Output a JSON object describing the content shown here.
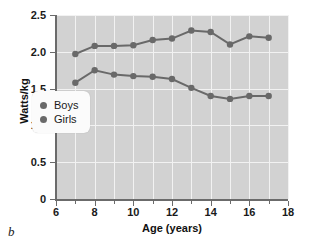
{
  "panel_label": "b",
  "chart_data": {
    "type": "line",
    "title": "",
    "xlabel": "Age (years)",
    "ylabel": "Watts/kg",
    "xlim": [
      6,
      18
    ],
    "ylim": [
      0,
      2.5
    ],
    "xticks": [
      6,
      8,
      10,
      12,
      14,
      16,
      18
    ],
    "xtick_labels": [
      "6",
      "8",
      "10",
      "12",
      "14",
      "16",
      "18"
    ],
    "xminorticks": [
      7,
      9,
      11,
      13,
      15,
      17
    ],
    "yticks": [
      0,
      0.5,
      1.0,
      1.5,
      2.0,
      2.5
    ],
    "ytick_labels": [
      "0",
      "0.5",
      "1.0",
      "1.5",
      "2.0",
      "2.5"
    ],
    "grid": true,
    "legend_position": "center-left",
    "plot_background": "#d2d2d2",
    "gridline_color": "#f2f2f2",
    "series_color": "#696969",
    "x": [
      7,
      8,
      9,
      10,
      11,
      12,
      13,
      14,
      15,
      16,
      17
    ],
    "series": [
      {
        "name": "Boys",
        "color": "#696969",
        "values": [
          1.97,
          2.08,
          2.08,
          2.09,
          2.16,
          2.18,
          2.29,
          2.27,
          2.1,
          2.21,
          2.19
        ]
      },
      {
        "name": "Girls",
        "color": "#696969",
        "values": [
          1.58,
          1.75,
          1.69,
          1.67,
          1.66,
          1.63,
          1.51,
          1.4,
          1.36,
          1.4,
          1.4
        ]
      }
    ]
  },
  "legend": {
    "items": [
      {
        "label": "Boys"
      },
      {
        "label": "Girls"
      }
    ]
  }
}
